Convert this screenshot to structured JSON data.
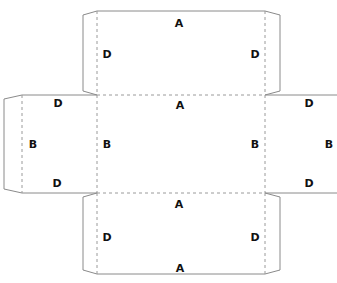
{
  "colors": {
    "cut_line": "#8a8a8a",
    "fold_line": "#9a9a9a",
    "label": "#111111",
    "background": "#ffffff"
  },
  "panels": {
    "top": {
      "labels": {
        "top": "A",
        "left": "D",
        "right": "D"
      }
    },
    "center": {
      "labels": {
        "top": "A",
        "left": "B",
        "right": "B"
      }
    },
    "left_side": {
      "labels": {
        "top": "D",
        "middle": "B",
        "bottom": "D"
      }
    },
    "right_side": {
      "labels": {
        "top": "D",
        "middle": "B",
        "bottom": "D"
      }
    },
    "bottom": {
      "labels": {
        "top": "A",
        "left": "D",
        "right": "D",
        "bottom": "A"
      }
    }
  }
}
